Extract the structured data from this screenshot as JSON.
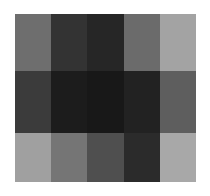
{
  "figure": {
    "type": "grayscale-block-grid",
    "background_color": "#ffffff",
    "width": 210,
    "height": 196
  },
  "chart_data": {
    "type": "heatmap",
    "title": "",
    "subtitle": "",
    "xlabel": "",
    "ylabel": "",
    "colormap": "gray",
    "grid": false,
    "legend": "none",
    "xtick_labels": [],
    "ytick_labels": [],
    "rows": 3,
    "cols": 5,
    "cell_colors": [
      [
        "#6e6e6e",
        "#333333",
        "#262626",
        "#6b6b6b",
        "#a3a3a3"
      ],
      [
        "#3b3b3b",
        "#1c1c1c",
        "#181818",
        "#222222",
        "#5e5e5e"
      ],
      [
        "#a0a0a0",
        "#757575",
        "#4f4f4f",
        "#2b2b2b",
        "#a8a8a8"
      ]
    ],
    "values": [
      [
        110,
        51,
        38,
        107,
        163
      ],
      [
        59,
        28,
        24,
        34,
        94
      ],
      [
        160,
        117,
        79,
        43,
        168
      ]
    ],
    "value_range": [
      24,
      168
    ]
  }
}
